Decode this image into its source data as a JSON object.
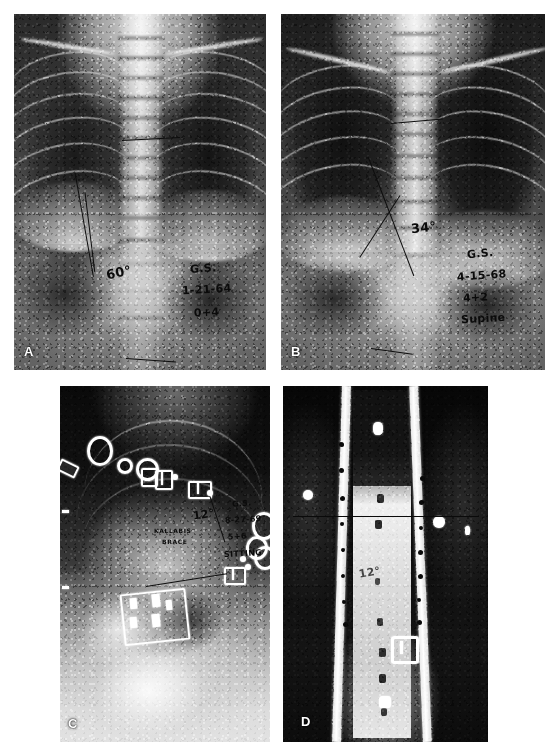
{
  "figure": {
    "type": "radiograph-panel-figure",
    "modality": "X-ray",
    "panel_count": 4,
    "background_color": "#ffffff",
    "film_color": "#000000",
    "ink_color": "#0b0b0b"
  },
  "panels": [
    {
      "letter": "A",
      "view": "chest-ap",
      "angle_label": "60°",
      "annotations": {
        "initials": "G.S.",
        "date": "1-21-64",
        "age": "0+4",
        "position": ""
      },
      "measurement_lines": 3,
      "description": "Upright anteroposterior chest radiograph of an infant showing thoracic curve with Cobb angle measurement"
    },
    {
      "letter": "B",
      "view": "chest-ap",
      "angle_label": "34°",
      "annotations": {
        "initials": "G.S.",
        "date": "4-15-68",
        "age": "4+2",
        "position": "Supine"
      },
      "measurement_lines": 4,
      "description": "Supine anteroposterior chest radiograph showing reduced curve with crossing Cobb lines"
    },
    {
      "letter": "C",
      "view": "chest-ap-braced",
      "angle_label": "12°",
      "brace_label_line1": "KALLABIS",
      "brace_label_line2": "BRACE",
      "annotations": {
        "initials": "G.S.",
        "date": "8-27-69",
        "age": "5+6",
        "position": "SITTING"
      },
      "measurement_lines": 2,
      "description": "Seated anteroposterior radiograph in Kallabis brace; radio-opaque brace hardware visible as bright rings, plates and dots"
    },
    {
      "letter": "D",
      "view": "spine-ap-braced-coned",
      "angle_label": "12°",
      "annotations": {
        "initials": "G.S.",
        "date": "9-24-69",
        "age": "",
        "position": ""
      },
      "measurement_lines": 1,
      "description": "Coned-down anteroposterior spine radiograph with two perforated brace uprights flanking the vertebral column"
    }
  ],
  "colors": {
    "ink": "#0b0b0b",
    "panel_letter": "#ffffff",
    "hardware": "#ffffff",
    "film_base": "#000000",
    "page": "#ffffff"
  }
}
